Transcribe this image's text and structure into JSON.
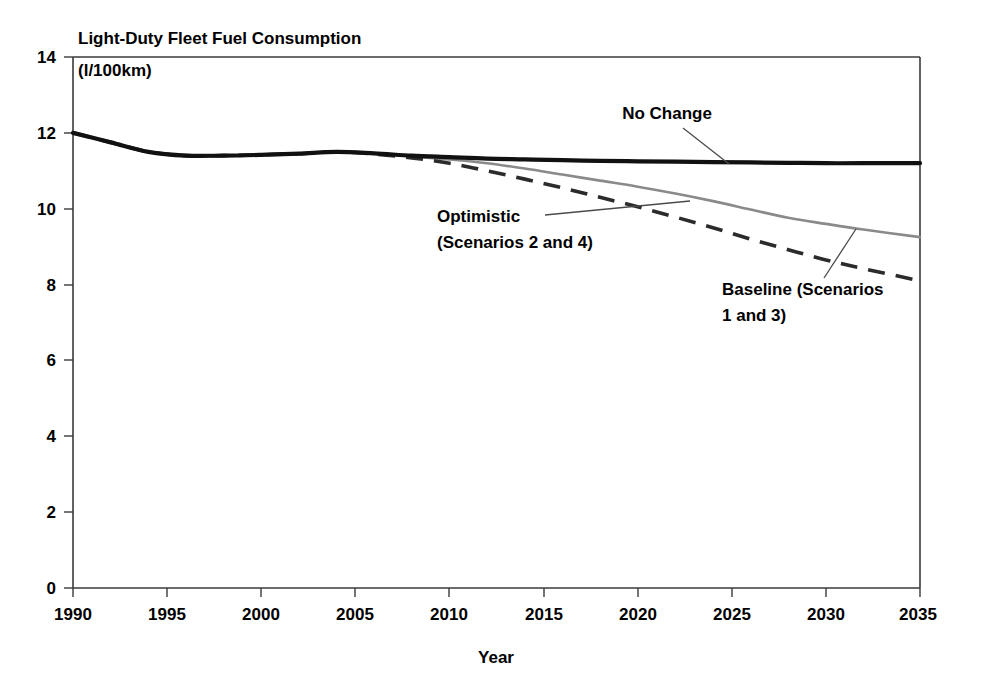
{
  "chart_data": {
    "type": "line",
    "title": "Light-Duty Fleet Fuel Consumption",
    "subtitle": "(l/100km)",
    "xlabel": "Year",
    "ylabel": "",
    "xlim": [
      1990,
      2035
    ],
    "ylim": [
      0,
      14
    ],
    "grid": false,
    "legend_position": "inline-annotations",
    "x_ticks": [
      1990,
      1995,
      2000,
      2005,
      2010,
      2015,
      2020,
      2025,
      2030,
      2035
    ],
    "y_ticks": [
      0,
      2,
      4,
      6,
      8,
      10,
      12,
      14
    ],
    "x": [
      1990,
      1992,
      1994,
      1996,
      1998,
      2000,
      2002,
      2004,
      2006,
      2008,
      2010,
      2012,
      2014,
      2016,
      2018,
      2020,
      2022,
      2024,
      2026,
      2028,
      2030,
      2032,
      2035
    ],
    "series": [
      {
        "name": "No Change",
        "style": "solid-thick-black",
        "color": "#111111",
        "values": [
          12.0,
          11.75,
          11.5,
          11.4,
          11.4,
          11.42,
          11.45,
          11.5,
          11.46,
          11.4,
          11.36,
          11.32,
          11.3,
          11.28,
          11.26,
          11.25,
          11.24,
          11.23,
          11.22,
          11.21,
          11.2,
          11.2,
          11.2
        ]
      },
      {
        "name": "Baseline (Scenarios 1 and 3)",
        "style": "solid-thin-gray",
        "color": "#8a8a8a",
        "values": [
          12.0,
          11.75,
          11.5,
          11.4,
          11.4,
          11.42,
          11.45,
          11.5,
          11.45,
          11.38,
          11.3,
          11.2,
          11.06,
          10.9,
          10.74,
          10.58,
          10.4,
          10.2,
          9.98,
          9.76,
          9.6,
          9.45,
          9.25
        ]
      },
      {
        "name": "Optimistic (Scenarios 2 and 4)",
        "style": "dashed-black",
        "color": "#2b2b2b",
        "values": [
          12.0,
          11.75,
          11.5,
          11.4,
          11.4,
          11.42,
          11.45,
          11.5,
          11.44,
          11.34,
          11.2,
          11.0,
          10.78,
          10.55,
          10.3,
          10.05,
          9.78,
          9.5,
          9.2,
          8.92,
          8.65,
          8.42,
          8.1
        ]
      }
    ],
    "annotations": [
      {
        "id": "no-change",
        "text": "No Change",
        "target_year": 2023,
        "target_value": 11.22
      },
      {
        "id": "optimistic",
        "line1": "Optimistic",
        "line2": "(Scenarios 2 and 4)",
        "target_year": 2022.5,
        "target_value": 10.25
      },
      {
        "id": "baseline",
        "line1": "Baseline (Scenarios",
        "line2": "1 and 3)",
        "target_year": 2031.5,
        "target_value": 9.5
      }
    ]
  },
  "axis": {
    "y_tick_labels": [
      "14",
      "12",
      "10",
      "8",
      "6",
      "4",
      "2",
      "0"
    ],
    "x_tick_labels": [
      "1990",
      "1995",
      "2000",
      "2005",
      "2010",
      "2015",
      "2020",
      "2025",
      "2030",
      "2035"
    ],
    "x_axis_title": "Year"
  },
  "header": {
    "title": "Light-Duty Fleet Fuel Consumption",
    "units": "(l/100km)"
  },
  "annotations": {
    "no_change": "No Change",
    "optimistic_l1": "Optimistic",
    "optimistic_l2": "(Scenarios 2 and 4)",
    "baseline_l1": "Baseline (Scenarios",
    "baseline_l2": "1 and 3)"
  },
  "colors": {
    "no_change": "#111111",
    "baseline": "#8a8a8a",
    "optimistic": "#2b2b2b",
    "axis": "#3a3a3a",
    "background": "#ffffff"
  }
}
